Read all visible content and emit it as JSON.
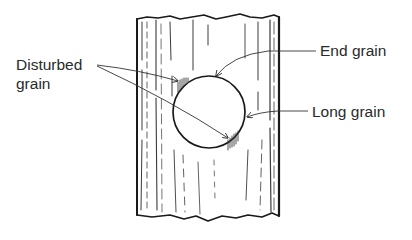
{
  "diagram": {
    "labels": {
      "disturbed_line1": "Disturbed",
      "disturbed_line2": "grain",
      "end_grain": "End grain",
      "long_grain": "Long grain"
    },
    "colors": {
      "ink": "#1a1a1a",
      "text": "#2a2a2a",
      "background": "#ffffff"
    }
  }
}
